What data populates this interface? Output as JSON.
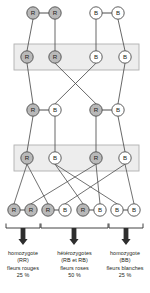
{
  "diagram": {
    "allele_labels": {
      "red": "R",
      "white": "B"
    },
    "generations": [
      {
        "name": "parents",
        "y": 13,
        "nodes": [
          {
            "label": "R",
            "type": "red",
            "x": 33
          },
          {
            "label": "R",
            "type": "red",
            "x": 55
          },
          {
            "label": "B",
            "type": "white",
            "x": 96
          },
          {
            "label": "B",
            "type": "white",
            "x": 118
          }
        ]
      },
      {
        "name": "gametes-1",
        "y": 57,
        "boxed": true,
        "nodes": [
          {
            "label": "R",
            "type": "red",
            "x": 27
          },
          {
            "label": "R",
            "type": "red",
            "x": 55
          },
          {
            "label": "B",
            "type": "white",
            "x": 96
          },
          {
            "label": "B",
            "type": "white",
            "x": 125
          }
        ]
      },
      {
        "name": "f1",
        "y": 110,
        "nodes": [
          {
            "label": "R",
            "type": "red",
            "x": 33
          },
          {
            "label": "B",
            "type": "white",
            "x": 55
          },
          {
            "label": "R",
            "type": "red",
            "x": 96
          },
          {
            "label": "B",
            "type": "white",
            "x": 118
          }
        ]
      },
      {
        "name": "gametes-2",
        "y": 158,
        "boxed": true,
        "nodes": [
          {
            "label": "R",
            "type": "red",
            "x": 27
          },
          {
            "label": "B",
            "type": "white",
            "x": 55
          },
          {
            "label": "R",
            "type": "red",
            "x": 96
          },
          {
            "label": "B",
            "type": "white",
            "x": 125
          }
        ]
      },
      {
        "name": "f2",
        "y": 210,
        "nodes": [
          {
            "label": "R",
            "type": "red",
            "x": 14
          },
          {
            "label": "R",
            "type": "red",
            "x": 31
          },
          {
            "label": "R",
            "type": "red",
            "x": 48
          },
          {
            "label": "B",
            "type": "white",
            "x": 65
          },
          {
            "label": "R",
            "type": "red",
            "x": 83
          },
          {
            "label": "B",
            "type": "white",
            "x": 100
          },
          {
            "label": "B",
            "type": "white",
            "x": 117
          },
          {
            "label": "B",
            "type": "white",
            "x": 134
          }
        ]
      }
    ],
    "outcomes": [
      {
        "zygosity": "homozygote",
        "genotype": "(RR)",
        "phenotype": "fleurs rouges",
        "percent": "25 %",
        "bracket": {
          "x1": 6,
          "x2": 40
        },
        "arrow_x": 23
      },
      {
        "zygosity": "hétérozygotes",
        "genotype": "(RB et RB)",
        "phenotype": "fleurs roses",
        "percent": "50 %",
        "bracket": {
          "x1": 41,
          "x2": 108
        },
        "arrow_x": 74
      },
      {
        "zygosity": "homozygote",
        "genotype": "(BB)",
        "phenotype": "fleurs blanches",
        "percent": "25 %",
        "bracket": {
          "x1": 109,
          "x2": 143
        },
        "arrow_x": 126
      }
    ],
    "colors": {
      "red_allele_fill": "#b9b9b9",
      "white_allele_fill": "#ffffff",
      "stroke": "#4d4d4d",
      "box_fill": "#ededed",
      "box_stroke": "#b0b0b0",
      "text": "#231f20",
      "arrow": "#2e2e2e"
    }
  }
}
